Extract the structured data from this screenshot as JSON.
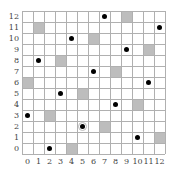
{
  "grid": {
    "cols": 13,
    "rows": 13,
    "cell_px": 11,
    "origin_left": 22,
    "origin_top": 11,
    "line_color": "#b0b0b0",
    "shade_color": "#bdbdbd",
    "dot_color": "#000000"
  },
  "x_labels": [
    "0",
    "1",
    "2",
    "3",
    "4",
    "5",
    "6",
    "7",
    "8",
    "9",
    "10",
    "11",
    "12"
  ],
  "y_labels": [
    "0",
    "1",
    "2",
    "3",
    "4",
    "5",
    "6",
    "7",
    "8",
    "9",
    "10",
    "11",
    "12"
  ],
  "shaded_cells": [
    {
      "col": 9,
      "row": 12
    },
    {
      "col": 1,
      "row": 11
    },
    {
      "col": 6,
      "row": 10
    },
    {
      "col": 11,
      "row": 9
    },
    {
      "col": 3,
      "row": 8
    },
    {
      "col": 8,
      "row": 7
    },
    {
      "col": 0,
      "row": 6
    },
    {
      "col": 5,
      "row": 5
    },
    {
      "col": 10,
      "row": 4
    },
    {
      "col": 2,
      "row": 3
    },
    {
      "col": 7,
      "row": 2
    },
    {
      "col": 12,
      "row": 1
    },
    {
      "col": 4,
      "row": 0
    }
  ],
  "dots": [
    {
      "col": 7,
      "row": 12
    },
    {
      "col": 12,
      "row": 11
    },
    {
      "col": 4,
      "row": 10
    },
    {
      "col": 9,
      "row": 9
    },
    {
      "col": 1,
      "row": 8
    },
    {
      "col": 6,
      "row": 7
    },
    {
      "col": 11,
      "row": 6
    },
    {
      "col": 3,
      "row": 5
    },
    {
      "col": 8,
      "row": 4
    },
    {
      "col": 0,
      "row": 3
    },
    {
      "col": 5,
      "row": 2,
      "circled": true
    },
    {
      "col": 10,
      "row": 1
    },
    {
      "col": 2,
      "row": 0
    }
  ]
}
